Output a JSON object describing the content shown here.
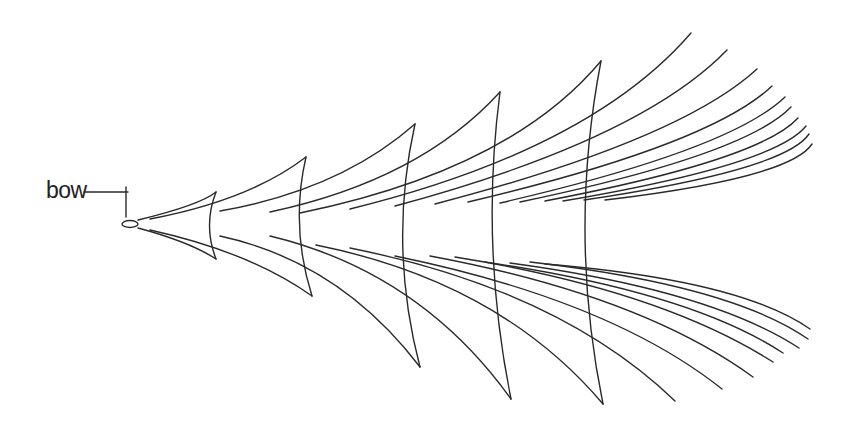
{
  "diagram": {
    "label": {
      "text": "bow",
      "x": 46,
      "y": 177
    },
    "stroke_color": "#2a2a2a",
    "background": "#ffffff",
    "leader": {
      "from": [
        84,
        192
      ],
      "to": [
        128,
        192
      ],
      "tick_top": 187,
      "tick_bottom": 217
    },
    "hull": {
      "cx": 130,
      "cy": 224,
      "rx": 8,
      "ry": 3.5
    },
    "crests": [
      {
        "top": [
          216,
          192
        ],
        "bottom": [
          216,
          259
        ],
        "ctrl": 203
      },
      {
        "top": [
          306,
          157
        ],
        "bottom": [
          312,
          296
        ],
        "ctrl": 290
      },
      {
        "top": [
          415,
          124
        ],
        "bottom": [
          420,
          367
        ],
        "ctrl": 388
      },
      {
        "top": [
          500,
          92
        ],
        "bottom": [
          511,
          399
        ],
        "ctrl": 480
      },
      {
        "top": [
          601,
          61
        ],
        "bottom": [
          603,
          404
        ],
        "ctrl": 568
      }
    ],
    "upper_lines": [
      {
        "start": [
          138,
          220
        ],
        "ctrl": [
          200,
          205
        ],
        "end": [
          216,
          192
        ]
      },
      {
        "start": [
          150,
          219
        ],
        "ctrl": [
          250,
          200
        ],
        "end": [
          306,
          157
        ]
      },
      {
        "start": [
          220,
          211
        ],
        "ctrl": [
          340,
          190
        ],
        "end": [
          415,
          124
        ]
      },
      {
        "start": [
          270,
          212
        ],
        "ctrl": [
          420,
          180
        ],
        "end": [
          500,
          92
        ]
      },
      {
        "start": [
          300,
          213
        ],
        "ctrl": [
          510,
          170
        ],
        "end": [
          601,
          61
        ]
      },
      {
        "start": [
          350,
          209
        ],
        "ctrl": [
          590,
          150
        ],
        "end": [
          691,
          33
        ]
      },
      {
        "start": [
          395,
          206
        ],
        "ctrl": [
          640,
          140
        ],
        "end": [
          727,
          50
        ]
      },
      {
        "start": [
          435,
          204
        ],
        "ctrl": [
          680,
          140
        ],
        "end": [
          757,
          69
        ]
      },
      {
        "start": [
          468,
          202
        ],
        "ctrl": [
          710,
          145
        ],
        "end": [
          772,
          86
        ]
      },
      {
        "start": [
          500,
          203
        ],
        "ctrl": [
          730,
          150
        ],
        "end": [
          785,
          97
        ]
      },
      {
        "start": [
          520,
          202
        ],
        "ctrl": [
          745,
          155
        ],
        "end": [
          791,
          107
        ]
      },
      {
        "start": [
          545,
          201
        ],
        "ctrl": [
          760,
          160
        ],
        "end": [
          798,
          118
        ]
      },
      {
        "start": [
          563,
          201
        ],
        "ctrl": [
          775,
          165
        ],
        "end": [
          806,
          126
        ]
      },
      {
        "start": [
          584,
          200
        ],
        "ctrl": [
          785,
          170
        ],
        "end": [
          809,
          134
        ]
      },
      {
        "start": [
          605,
          200
        ],
        "ctrl": [
          790,
          178
        ],
        "end": [
          812,
          144
        ]
      }
    ],
    "lower_lines": [
      {
        "start": [
          138,
          228
        ],
        "ctrl": [
          190,
          242
        ],
        "end": [
          216,
          259
        ]
      },
      {
        "start": [
          150,
          230
        ],
        "ctrl": [
          250,
          252
        ],
        "end": [
          312,
          296
        ]
      },
      {
        "start": [
          220,
          236
        ],
        "ctrl": [
          340,
          262
        ],
        "end": [
          420,
          367
        ]
      },
      {
        "start": [
          270,
          236
        ],
        "ctrl": [
          420,
          272
        ],
        "end": [
          511,
          399
        ]
      },
      {
        "start": [
          316,
          245
        ],
        "ctrl": [
          500,
          282
        ],
        "end": [
          603,
          404
        ]
      },
      {
        "start": [
          350,
          248
        ],
        "ctrl": [
          560,
          290
        ],
        "end": [
          675,
          401
        ]
      },
      {
        "start": [
          395,
          256
        ],
        "ctrl": [
          610,
          300
        ],
        "end": [
          722,
          389
        ]
      },
      {
        "start": [
          430,
          256
        ],
        "ctrl": [
          640,
          295
        ],
        "end": [
          753,
          377
        ]
      },
      {
        "start": [
          455,
          257
        ],
        "ctrl": [
          660,
          290
        ],
        "end": [
          773,
          362
        ]
      },
      {
        "start": [
          485,
          262
        ],
        "ctrl": [
          690,
          292
        ],
        "end": [
          783,
          353
        ]
      },
      {
        "start": [
          510,
          263
        ],
        "ctrl": [
          710,
          290
        ],
        "end": [
          799,
          348
        ]
      },
      {
        "start": [
          530,
          262
        ],
        "ctrl": [
          730,
          285
        ],
        "end": [
          808,
          339
        ]
      },
      {
        "start": [
          545,
          264
        ],
        "ctrl": [
          740,
          280
        ],
        "end": [
          810,
          329
        ]
      }
    ]
  }
}
